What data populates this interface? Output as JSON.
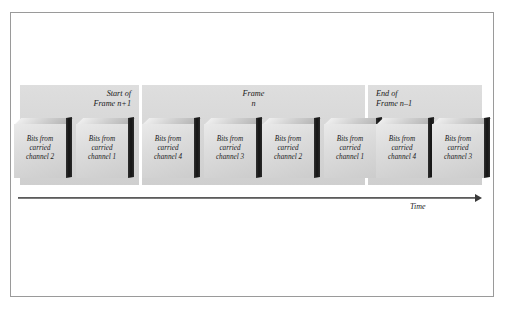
{
  "figure": {
    "axis": {
      "label": "Time",
      "arrow_icon": "arrow-right-icon"
    },
    "colors": {
      "band_fill": "#d7d7d7",
      "block_face": "#dcdcdc",
      "block_side": "#151515",
      "border": "#9a9a9a",
      "text": "#1a1a1a",
      "background": "#ffffff"
    }
  },
  "bands": [
    {
      "id": "prev",
      "label_line1": "Start of",
      "label_line2": "Frame n+1"
    },
    {
      "id": "curr",
      "label_line1": "Frame",
      "label_line2": "n"
    },
    {
      "id": "next",
      "label_line1": "End of",
      "label_line2": "Frame n–1"
    }
  ],
  "blocks": [
    {
      "line1": "Bits from",
      "line2": "carried",
      "line3": "channel 2"
    },
    {
      "line1": "Bits from",
      "line2": "carried",
      "line3": "channel 1"
    },
    {
      "line1": "Bits from",
      "line2": "carried",
      "line3": "channel 4"
    },
    {
      "line1": "Bits from",
      "line2": "carried",
      "line3": "channel 3"
    },
    {
      "line1": "Bits from",
      "line2": "carried",
      "line3": "channel 2"
    },
    {
      "line1": "Bits from",
      "line2": "carried",
      "line3": "channel 1"
    },
    {
      "line1": "Bits from",
      "line2": "carried",
      "line3": "channel 4"
    },
    {
      "line1": "Bits from",
      "line2": "carried",
      "line3": "channel 3"
    }
  ]
}
